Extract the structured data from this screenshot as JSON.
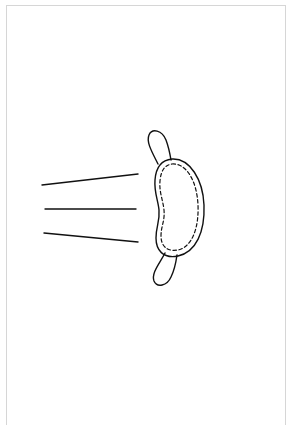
{
  "diagram": {
    "caption": "",
    "colors": {
      "stroke": "#111111",
      "frame": "#d6d6d6",
      "background": "#ffffff"
    },
    "motion_lines": [
      {
        "x1": 42,
        "y1": 185,
        "x2": 138,
        "y2": 174
      },
      {
        "x1": 45,
        "y1": 209,
        "x2": 136,
        "y2": 209
      },
      {
        "x1": 44,
        "y1": 233,
        "x2": 138,
        "y2": 242
      }
    ]
  }
}
